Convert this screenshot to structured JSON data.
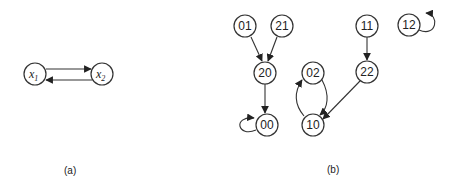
{
  "panels": [
    {
      "caption": "(a)",
      "nodes": [
        {
          "id": "x1",
          "base": "x",
          "sub": "1"
        },
        {
          "id": "x2",
          "base": "x",
          "sub": "2"
        }
      ],
      "edges": [
        {
          "from": "x1",
          "to": "x2"
        },
        {
          "from": "x2",
          "to": "x1"
        }
      ]
    },
    {
      "caption": "(b)",
      "nodes": [
        {
          "id": "01",
          "label": "01"
        },
        {
          "id": "21",
          "label": "21"
        },
        {
          "id": "20",
          "label": "20"
        },
        {
          "id": "00",
          "label": "00"
        },
        {
          "id": "02",
          "label": "02"
        },
        {
          "id": "10",
          "label": "10"
        },
        {
          "id": "11",
          "label": "11"
        },
        {
          "id": "22",
          "label": "22"
        },
        {
          "id": "12",
          "label": "12"
        }
      ],
      "edges": [
        {
          "from": "01",
          "to": "20"
        },
        {
          "from": "21",
          "to": "20"
        },
        {
          "from": "20",
          "to": "00"
        },
        {
          "from": "00",
          "to": "00",
          "self_loop": true
        },
        {
          "from": "02",
          "to": "10"
        },
        {
          "from": "10",
          "to": "02"
        },
        {
          "from": "11",
          "to": "22"
        },
        {
          "from": "22",
          "to": "10"
        },
        {
          "from": "12",
          "to": "12",
          "self_loop": true
        }
      ]
    }
  ],
  "colors": {
    "stroke": "#333333",
    "text": "#222222",
    "background": "#ffffff"
  }
}
